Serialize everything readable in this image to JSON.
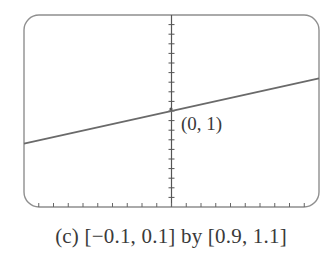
{
  "chart_data": {
    "type": "line",
    "title": "",
    "caption": "(c) [−0.1, 0.1] by [0.9, 1.1]",
    "xlabel": "",
    "ylabel": "",
    "xlim": [
      -0.1,
      0.1
    ],
    "ylim": [
      0.9,
      1.1
    ],
    "xscale_ticks": 0.01,
    "yscale_ticks": 0.01,
    "grid": false,
    "legend": null,
    "series": [
      {
        "name": "curve near (0,1)",
        "x": [
          -0.1,
          0,
          0.1
        ],
        "y": [
          0.966,
          1.0,
          1.034
        ]
      }
    ],
    "annotations": [
      {
        "text": "(0, 1)",
        "x": 0,
        "y": 1
      }
    ],
    "colors": {
      "frame": "#8a8a8a",
      "line": "#6e6e6e",
      "axis": "#555555"
    }
  },
  "labels": {
    "point": "(0, 1)",
    "caption": "(c) [−0.1, 0.1] by [0.9, 1.1]"
  }
}
